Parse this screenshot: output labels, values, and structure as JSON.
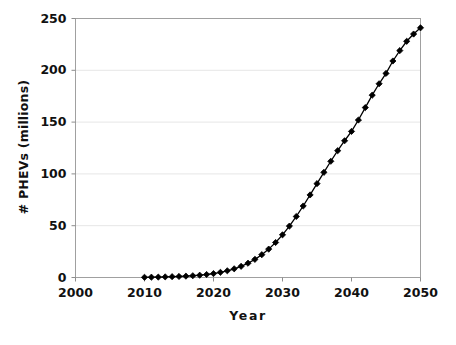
{
  "chart_data": {
    "type": "line",
    "title": "",
    "subtitle": "",
    "xlabel": "Year",
    "ylabel": "# PHEVs (millions)",
    "xlim": [
      2000,
      2050
    ],
    "ylim": [
      0,
      250
    ],
    "xticks": [
      2000,
      2010,
      2020,
      2030,
      2040,
      2050
    ],
    "yticks": [
      0,
      50,
      100,
      150,
      200,
      250
    ],
    "xtick_labels": [
      "2000",
      "2010",
      "2020",
      "2030",
      "2040",
      "2050"
    ],
    "ytick_labels": [
      "0",
      "50",
      "100",
      "150",
      "200",
      "250"
    ],
    "grid": "horizontal",
    "legend": "none",
    "marker": "diamond",
    "marker_color": "#000000",
    "line_color": "#000000",
    "grid_color": "#e6e6e6",
    "frame_color": "#a0a0a0",
    "series": [
      {
        "name": "# PHEVs (millions)",
        "x": [
          2010,
          2011,
          2012,
          2013,
          2014,
          2015,
          2016,
          2017,
          2018,
          2019,
          2020,
          2021,
          2022,
          2023,
          2024,
          2025,
          2026,
          2027,
          2028,
          2029,
          2030,
          2031,
          2032,
          2033,
          2034,
          2035,
          2036,
          2037,
          2038,
          2039,
          2040,
          2041,
          2042,
          2043,
          2044,
          2045,
          2046,
          2047,
          2048,
          2049,
          2050
        ],
        "values": [
          0.2,
          0.3,
          0.4,
          0.6,
          0.8,
          1.0,
          1.3,
          1.7,
          2.2,
          2.9,
          3.8,
          5.0,
          6.5,
          8.4,
          10.8,
          13.8,
          17.5,
          22.0,
          27.4,
          33.8,
          41.2,
          49.6,
          58.9,
          69.0,
          79.7,
          90.6,
          101.5,
          112.2,
          122.4,
          132.0,
          141.0,
          152.0,
          164.0,
          176.0,
          187.0,
          197.0,
          209.0,
          219.0,
          228.0,
          235.0,
          241.0
        ]
      }
    ]
  },
  "axes": {
    "y_title": "# PHEVs (millions)",
    "x_title": "Year"
  }
}
